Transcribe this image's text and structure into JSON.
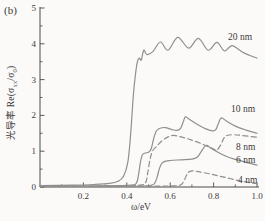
{
  "panel_label": "(b)",
  "chart_data": {
    "type": "line",
    "title": "",
    "xlabel": "ω/eV",
    "ylabel_parts": {
      "pre": "光导率 Re(σ",
      "sub1": "xx",
      "mid": "/σ",
      "sub2": "0",
      "post": ")"
    },
    "xlim": [
      0,
      1.0
    ],
    "ylim": [
      0,
      5
    ],
    "grid": false,
    "legend_position": "inline-labels-right",
    "x_major_ticks": [
      0.2,
      0.4,
      0.6,
      0.8,
      1.0
    ],
    "x_tick_labels": [
      "0.2",
      "0.4",
      "0.6",
      "0.8",
      "1.0"
    ],
    "x_minor_ticks": [
      0.1,
      0.3,
      0.5,
      0.7,
      0.9
    ],
    "y_major_ticks": [
      0,
      1,
      2,
      3,
      4,
      5
    ],
    "y_tick_labels": [
      "0",
      "1",
      "2",
      "3",
      "4",
      "5"
    ],
    "y_minor_ticks": [
      0.5,
      1.5,
      2.5,
      3.5,
      4.5
    ],
    "colors": {
      "curve": "#8f8f8f",
      "axis": "#4a4a4a",
      "text": "#3b3b3b",
      "background": "#fbfaf8"
    },
    "series": [
      {
        "name": "20 nm",
        "style": "solid",
        "label_px": {
          "x": 228,
          "y": 40
        },
        "points": [
          [
            0,
            0.04
          ],
          [
            0.15,
            0.05
          ],
          [
            0.25,
            0.07
          ],
          [
            0.32,
            0.1
          ],
          [
            0.36,
            0.16
          ],
          [
            0.385,
            0.3
          ],
          [
            0.405,
            0.7
          ],
          [
            0.418,
            1.5
          ],
          [
            0.43,
            2.55
          ],
          [
            0.44,
            3.15
          ],
          [
            0.449,
            3.5
          ],
          [
            0.458,
            3.6
          ],
          [
            0.467,
            3.55
          ],
          [
            0.478,
            3.82
          ],
          [
            0.493,
            3.7
          ],
          [
            0.52,
            3.78
          ],
          [
            0.555,
            4.05
          ],
          [
            0.59,
            3.82
          ],
          [
            0.635,
            4.18
          ],
          [
            0.685,
            3.88
          ],
          [
            0.73,
            4.15
          ],
          [
            0.775,
            3.82
          ],
          [
            0.815,
            4.04
          ],
          [
            0.85,
            3.8
          ],
          [
            0.885,
            3.95
          ],
          [
            0.93,
            3.78
          ],
          [
            0.965,
            3.68
          ],
          [
            1.0,
            3.6
          ]
        ]
      },
      {
        "name": "10 nm",
        "style": "solid",
        "label_px": {
          "x": 231,
          "y": 112
        },
        "points": [
          [
            0,
            0.03
          ],
          [
            0.3,
            0.03
          ],
          [
            0.42,
            0.05
          ],
          [
            0.445,
            0.12
          ],
          [
            0.455,
            0.38
          ],
          [
            0.463,
            0.7
          ],
          [
            0.472,
            0.9
          ],
          [
            0.485,
            0.95
          ],
          [
            0.5,
            0.97
          ],
          [
            0.512,
            1.06
          ],
          [
            0.525,
            1.38
          ],
          [
            0.537,
            1.57
          ],
          [
            0.553,
            1.64
          ],
          [
            0.578,
            1.66
          ],
          [
            0.605,
            1.61
          ],
          [
            0.63,
            1.58
          ],
          [
            0.648,
            1.64
          ],
          [
            0.66,
            1.82
          ],
          [
            0.67,
            1.96
          ],
          [
            0.688,
            1.89
          ],
          [
            0.722,
            1.76
          ],
          [
            0.762,
            1.63
          ],
          [
            0.795,
            1.57
          ],
          [
            0.81,
            1.6
          ],
          [
            0.823,
            1.79
          ],
          [
            0.836,
            1.93
          ],
          [
            0.862,
            1.83
          ],
          [
            0.9,
            1.7
          ],
          [
            0.95,
            1.59
          ],
          [
            1.0,
            1.5
          ]
        ]
      },
      {
        "name": "8 nm",
        "style": "dashed",
        "label_px": {
          "x": 236,
          "y": 150
        },
        "points": [
          [
            0,
            0.03
          ],
          [
            0.35,
            0.03
          ],
          [
            0.46,
            0.05
          ],
          [
            0.487,
            0.13
          ],
          [
            0.497,
            0.42
          ],
          [
            0.508,
            0.8
          ],
          [
            0.52,
            1.02
          ],
          [
            0.535,
            1.12
          ],
          [
            0.56,
            1.28
          ],
          [
            0.59,
            1.4
          ],
          [
            0.615,
            1.44
          ],
          [
            0.65,
            1.4
          ],
          [
            0.7,
            1.31
          ],
          [
            0.755,
            1.18
          ],
          [
            0.8,
            1.06
          ],
          [
            0.815,
            1.03
          ],
          [
            0.832,
            1.17
          ],
          [
            0.847,
            1.36
          ],
          [
            0.862,
            1.44
          ],
          [
            0.89,
            1.46
          ],
          [
            0.93,
            1.44
          ],
          [
            1.0,
            1.39
          ]
        ]
      },
      {
        "name": "6 nm",
        "style": "solid",
        "label_px": {
          "x": 236,
          "y": 163
        },
        "points": [
          [
            0,
            0.02
          ],
          [
            0.4,
            0.02
          ],
          [
            0.5,
            0.04
          ],
          [
            0.525,
            0.08
          ],
          [
            0.538,
            0.24
          ],
          [
            0.548,
            0.47
          ],
          [
            0.558,
            0.63
          ],
          [
            0.572,
            0.71
          ],
          [
            0.6,
            0.74
          ],
          [
            0.65,
            0.76
          ],
          [
            0.7,
            0.78
          ],
          [
            0.724,
            0.83
          ],
          [
            0.74,
            0.96
          ],
          [
            0.755,
            1.1
          ],
          [
            0.768,
            1.16
          ],
          [
            0.787,
            1.09
          ],
          [
            0.82,
            0.97
          ],
          [
            0.86,
            0.85
          ],
          [
            0.9,
            0.77
          ],
          [
            0.95,
            0.69
          ],
          [
            1.0,
            0.61
          ]
        ]
      },
      {
        "name": "4 nm",
        "style": "dashed",
        "label_px": {
          "x": 238,
          "y": 183
        },
        "points": [
          [
            0,
            0.02
          ],
          [
            0.45,
            0.02
          ],
          [
            0.6,
            0.03
          ],
          [
            0.645,
            0.05
          ],
          [
            0.662,
            0.15
          ],
          [
            0.673,
            0.3
          ],
          [
            0.684,
            0.41
          ],
          [
            0.7,
            0.45
          ],
          [
            0.73,
            0.43
          ],
          [
            0.78,
            0.37
          ],
          [
            0.83,
            0.3
          ],
          [
            0.88,
            0.23
          ],
          [
            0.93,
            0.16
          ],
          [
            1.0,
            0.09
          ]
        ]
      }
    ]
  }
}
